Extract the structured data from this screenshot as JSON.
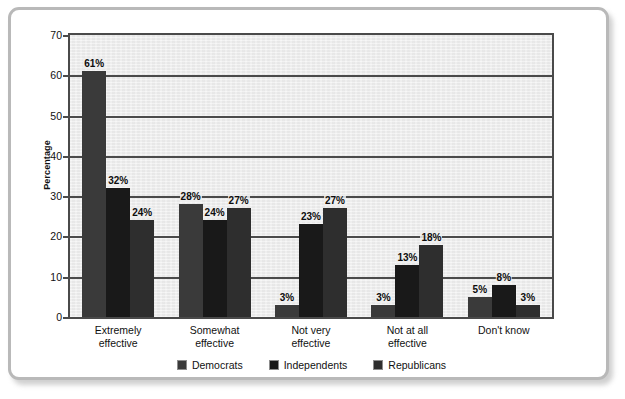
{
  "chart_data": {
    "type": "bar",
    "title": "",
    "subtitle": "",
    "xlabel": "",
    "ylabel": "Percentage",
    "ylim": [
      0,
      70
    ],
    "ytick_step": 10,
    "yticks": [
      0,
      10,
      20,
      30,
      40,
      50,
      60,
      70
    ],
    "grid": true,
    "grid_axis": "y",
    "legend_position": "bottom-center",
    "value_suffix": "%",
    "categories": [
      "Extremely effective",
      "Somewhat effective",
      "Not very effective",
      "Not at all effective",
      "Don't know"
    ],
    "category_lines": [
      [
        "Extremely",
        "effective"
      ],
      [
        "Somewhat",
        "effective"
      ],
      [
        "Not very",
        "effective"
      ],
      [
        "Not at all",
        "effective"
      ],
      [
        "Don't know",
        ""
      ]
    ],
    "series": [
      {
        "name": "Democrats",
        "color": "#3a3a3a",
        "values": [
          61,
          28,
          3,
          3,
          5
        ],
        "labels": [
          "61%",
          "28%",
          "3%",
          "3%",
          "5%"
        ]
      },
      {
        "name": "Independents",
        "color": "#191919",
        "values": [
          32,
          24,
          23,
          13,
          8
        ],
        "labels": [
          "32%",
          "24%",
          "23%",
          "13%",
          "8%"
        ]
      },
      {
        "name": "Republicans",
        "color": "#2e2e2e",
        "values": [
          24,
          27,
          27,
          18,
          3
        ],
        "labels": [
          "24%",
          "27%",
          "27%",
          "18%",
          "3%"
        ]
      }
    ]
  },
  "axis": {
    "y_title": "Percentage",
    "y_tick_labels": [
      "70",
      "60",
      "50",
      "40",
      "30",
      "20",
      "10",
      "0"
    ]
  },
  "legend": {
    "items": [
      {
        "label": "Democrats",
        "color": "#3a3a3a"
      },
      {
        "label": "Independents",
        "color": "#191919"
      },
      {
        "label": "Republicans",
        "color": "#2e2e2e"
      }
    ]
  },
  "style": {
    "plot_background": "#eeeeee",
    "frame_border": "#b9b9b9",
    "axis_color": "#4a4a4a",
    "text_color": "#111111"
  }
}
